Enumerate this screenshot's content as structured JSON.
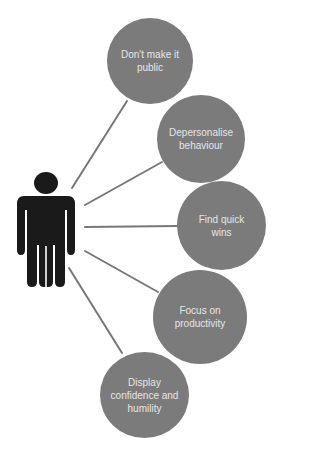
{
  "diagram": {
    "type": "hub-and-spoke",
    "center": {
      "icon": "person-icon",
      "color": "#1a1a1a"
    },
    "connector_color": "#777777",
    "bubble_color": "#7b7b7b",
    "text_color": "#e6e6e6",
    "nodes": [
      {
        "label": "Don't make it public"
      },
      {
        "label": "Depersonalise behaviour"
      },
      {
        "label": "Find quick wins"
      },
      {
        "label": "Focus on productivity"
      },
      {
        "label": "Display confidence and humility"
      }
    ]
  }
}
